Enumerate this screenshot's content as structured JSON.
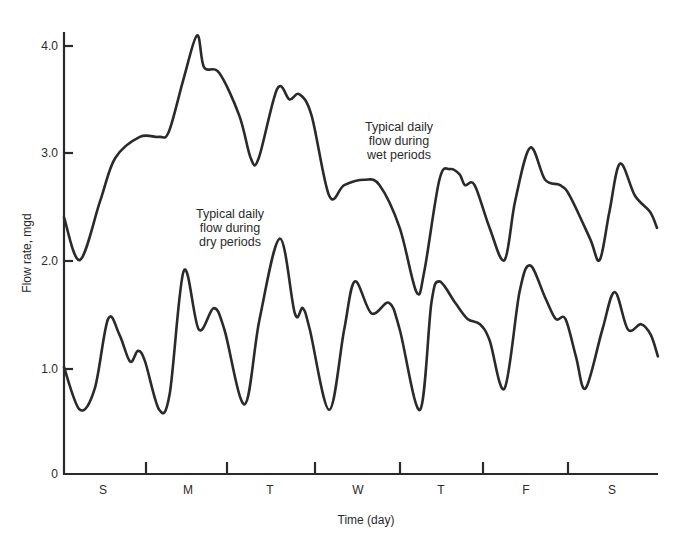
{
  "chart_data": {
    "type": "line",
    "title": "",
    "xlabel": "Time (day)",
    "ylabel": "Flow rate, mgd",
    "ylim": [
      0,
      4.2
    ],
    "grid": false,
    "legend": "none (curves labeled by in-plot annotations)",
    "y_ticks": [
      "0",
      "1.0",
      "2.0",
      "3.0",
      "4.0"
    ],
    "x_ticks": [
      "S",
      "M",
      "T",
      "W",
      "T",
      "F",
      "S"
    ],
    "x_tick_note": "Day labels centered between tick marks; x in days from start (0 to 7)",
    "series": [
      {
        "name": "Typical daily flow during wet periods",
        "x": [
          0.0,
          0.18,
          0.41,
          0.58,
          0.86,
          1.08,
          1.19,
          1.36,
          1.51,
          1.59,
          1.76,
          1.99,
          2.12,
          2.21,
          2.42,
          2.56,
          2.67,
          2.81,
          3.01,
          3.18,
          3.41,
          3.58,
          3.81,
          4.0,
          4.09,
          4.26,
          4.38,
          4.49,
          4.55,
          4.66,
          4.83,
          5.0,
          5.12,
          5.29,
          5.46,
          5.63,
          5.74,
          5.97,
          6.08,
          6.19,
          6.31,
          6.48,
          6.65,
          6.73
        ],
        "values": [
          2.4,
          2.0,
          2.55,
          2.95,
          3.15,
          3.15,
          3.2,
          3.7,
          4.1,
          3.8,
          3.75,
          3.35,
          2.95,
          2.95,
          3.6,
          3.5,
          3.55,
          3.35,
          2.6,
          2.7,
          2.75,
          2.7,
          2.3,
          1.7,
          1.9,
          2.75,
          2.85,
          2.8,
          2.7,
          2.7,
          2.3,
          2.0,
          2.55,
          3.05,
          2.75,
          2.7,
          2.6,
          2.2,
          2.0,
          2.45,
          2.9,
          2.6,
          2.45,
          2.3
        ]
      },
      {
        "name": "Typical daily flow during dry periods",
        "x": [
          0.0,
          0.18,
          0.35,
          0.5,
          0.63,
          0.75,
          0.84,
          0.92,
          1.08,
          1.2,
          1.36,
          1.53,
          1.7,
          1.82,
          2.05,
          2.22,
          2.45,
          2.62,
          2.71,
          2.79,
          3.01,
          3.18,
          3.3,
          3.49,
          3.69,
          3.81,
          4.04,
          4.17,
          4.26,
          4.44,
          4.58,
          4.72,
          4.83,
          5.0,
          5.17,
          5.29,
          5.46,
          5.58,
          5.69,
          5.81,
          5.92,
          6.11,
          6.25,
          6.4,
          6.55,
          6.66,
          6.74
        ],
        "values": [
          1.0,
          0.6,
          0.8,
          1.45,
          1.3,
          1.05,
          1.15,
          1.05,
          0.6,
          0.75,
          1.9,
          1.35,
          1.55,
          1.35,
          0.65,
          1.45,
          2.2,
          1.5,
          1.55,
          1.35,
          0.6,
          1.35,
          1.8,
          1.5,
          1.6,
          1.35,
          0.6,
          1.6,
          1.8,
          1.6,
          1.45,
          1.4,
          1.25,
          0.8,
          1.7,
          1.95,
          1.65,
          1.45,
          1.45,
          1.1,
          0.8,
          1.35,
          1.7,
          1.35,
          1.4,
          1.3,
          1.1
        ]
      }
    ],
    "annotations": [
      {
        "text": "Typical daily flow during wet periods",
        "near": "upper curve, Wednesday–Thursday"
      },
      {
        "text": "Typical daily flow during dry periods",
        "near": "lower curve, Monday–Tuesday"
      }
    ]
  },
  "axes": {
    "y_title": "Flow rate, mgd",
    "x_title": "Time (day)",
    "y_ticks": [
      {
        "label": "0",
        "y": 474
      },
      {
        "label": "1.0",
        "y": 369
      },
      {
        "label": "2.0",
        "y": 261
      },
      {
        "label": "3.0",
        "y": 153
      },
      {
        "label": "4.0",
        "y": 46
      }
    ],
    "x_day_labels": [
      {
        "label": "S",
        "x": 103
      },
      {
        "label": "M",
        "x": 188
      },
      {
        "label": "T",
        "x": 270
      },
      {
        "label": "W",
        "x": 358
      },
      {
        "label": "T",
        "x": 441
      },
      {
        "label": "F",
        "x": 526
      },
      {
        "label": "S",
        "x": 612
      }
    ],
    "x_tick_marks": [
      146,
      227,
      315,
      400,
      483,
      568
    ]
  },
  "annotations": {
    "wet": [
      "Typical daily",
      "flow during",
      "wet periods"
    ],
    "dry": [
      "Typical daily",
      "flow during",
      "dry periods"
    ]
  },
  "colors": {
    "ink": "#2a2a2a",
    "background": "#ffffff"
  }
}
